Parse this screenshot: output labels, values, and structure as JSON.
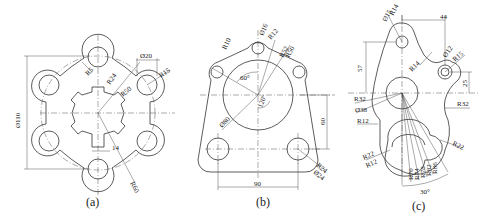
{
  "figures": [
    {
      "id": "a",
      "caption": "(a)",
      "description": "Six-lobed flange with splined centre hole",
      "dimensions": {
        "overall_dia": "Ø110",
        "hole_dia": "Ø20",
        "lobe_radius": "R15",
        "fillet_radius": "R5",
        "spline_outer": "R24",
        "bolt_circle": "R50",
        "outer_arc": "R60",
        "key_width": "14"
      }
    },
    {
      "id": "b",
      "caption": "(b)",
      "description": "Triangular plate with large bore and mounting holes",
      "dimensions": {
        "top_hole_dia": "Ø16",
        "top_radius": "R12",
        "side_radius": "R10",
        "arc1": "R52",
        "arc2": "R50",
        "angle_a": "60°",
        "angle_b": "120°",
        "bore_dia": "Ø80",
        "vertical_dist": "60",
        "bottom_radius": "R24",
        "bottom_hole_dia": "Ø24",
        "horizontal_dist": "90"
      }
    },
    {
      "id": "c",
      "caption": "(c)",
      "description": "Cam-shaped lever with arc slot",
      "dimensions": {
        "top_hole_dia": "Ø15",
        "top_radius": "R14",
        "horiz_offset": "44",
        "vert_offset": "57",
        "concave_radius": "R14",
        "right_hole_dia": "Ø12",
        "right_radius": "R15",
        "right_vert": "25",
        "left_radius": "R32",
        "right_concave": "R32",
        "centre_dia": "Ø38",
        "left_fillet": "R12",
        "slot_right": "R22",
        "slot_left": "R22",
        "slot_inner": "R12",
        "arc_radii": [
          "R70",
          "R74",
          "R78",
          "R82",
          "R86"
        ],
        "slot_angle": "30°"
      }
    }
  ]
}
